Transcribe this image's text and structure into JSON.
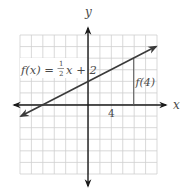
{
  "chart_data": {
    "type": "line",
    "title": "",
    "xlabel": "x",
    "ylabel": "y",
    "xlim": [
      -6,
      6
    ],
    "ylim": [
      -6,
      6
    ],
    "grid": true,
    "grid_step": 1,
    "series": [
      {
        "name": "f(x) = 1/2 x + 2",
        "equation": "f(x) = (1/2)x + 2",
        "slope": 0.5,
        "intercept": 2,
        "x": [
          -6,
          6
        ],
        "y": [
          -1,
          5
        ]
      }
    ],
    "annotations": [
      {
        "text": "f(4)",
        "type": "vertical-segment",
        "x": 4,
        "from_y": 0,
        "to_y": 4
      },
      {
        "text": "4",
        "type": "tick-label",
        "x": 4,
        "y": 0
      }
    ]
  },
  "labels": {
    "axis_x": "x",
    "axis_y": "y",
    "equation_prefix": "f(x) = ",
    "equation_num": "1",
    "equation_den": "2",
    "equation_suffix": "x + 2",
    "f4": "f(4)",
    "tick_4": "4"
  },
  "colors": {
    "grid": "#cfcfcf",
    "axis": "#1a1a1a",
    "line": "#3a3a3a",
    "text": "#4a4a4a"
  }
}
